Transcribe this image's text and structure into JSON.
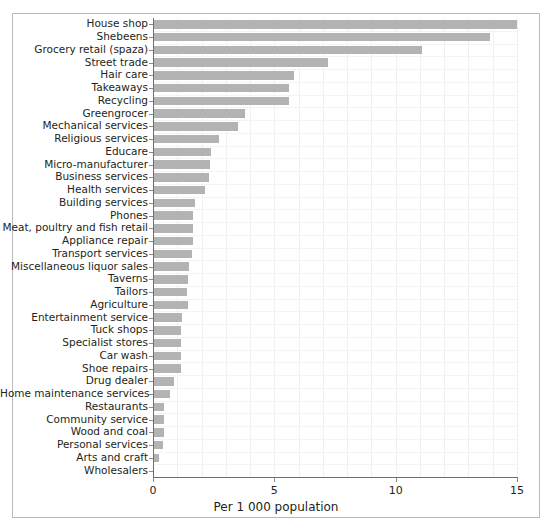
{
  "chart_data": {
    "type": "bar",
    "orientation": "horizontal",
    "title": "",
    "xlabel": "Per 1 000 population",
    "ylabel": "",
    "xlim": [
      0,
      15
    ],
    "xticks": [
      0,
      5,
      10,
      15
    ],
    "xtick_labels": [
      "0",
      "5",
      "10",
      "15"
    ],
    "grid": true,
    "legend": null,
    "bar_color": "#b3b3b3",
    "categories": [
      "House shop",
      "Shebeens",
      "Grocery retail (spaza)",
      "Street trade",
      "Hair care",
      "Takeaways",
      "Recycling",
      "Greengrocer",
      "Mechanical services",
      "Religious services",
      "Educare",
      "Micro-manufacturer",
      "Business services",
      "Health services",
      "Building services",
      "Phones",
      "Meat, poultry and fish retail",
      "Appliance repair",
      "Transport services",
      "Miscellaneous liquor sales",
      "Taverns",
      "Tailors",
      "Agriculture",
      "Entertainment service",
      "Tuck shops",
      "Specialist stores",
      "Car wash",
      "Shoe repairs",
      "Drug dealer",
      "Home maintenance services",
      "Restaurants",
      "Community service",
      "Wood and coal",
      "Personal services",
      "Arts and craft",
      "Wholesalers"
    ],
    "values": [
      15.0,
      13.9,
      11.1,
      7.2,
      5.8,
      5.6,
      5.6,
      3.8,
      3.5,
      2.7,
      2.4,
      2.35,
      2.3,
      2.15,
      1.75,
      1.65,
      1.65,
      1.65,
      1.6,
      1.5,
      1.45,
      1.4,
      1.45,
      1.2,
      1.15,
      1.15,
      1.15,
      1.15,
      0.85,
      0.7,
      0.45,
      0.45,
      0.45,
      0.4,
      0.25,
      0.02
    ]
  },
  "axis": {
    "x_label": "Per 1 000 population",
    "tick_labels": [
      "0",
      "5",
      "10",
      "15"
    ]
  }
}
